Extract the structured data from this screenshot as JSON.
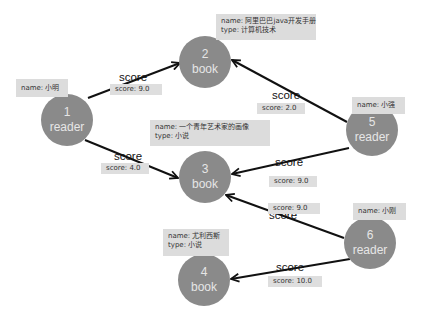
{
  "colors": {
    "node_fill": "#8a8a8a",
    "node_text": "#e6e6e6",
    "edge": "#111111",
    "label_box": "#dcdcdc"
  },
  "nodes": [
    {
      "id": "1",
      "type": "reader",
      "props": {
        "name": "name:  小明"
      }
    },
    {
      "id": "2",
      "type": "book",
      "props": {
        "name": "name:  阿里巴巴java开发手册",
        "type": "type: 计算机技术"
      }
    },
    {
      "id": "3",
      "type": "book",
      "props": {
        "name": "name:  一个青年艺术家的画像",
        "type": "type: 小说"
      }
    },
    {
      "id": "4",
      "type": "book",
      "props": {
        "name": "name:  尤利西斯",
        "type": "type: 小说"
      }
    },
    {
      "id": "5",
      "type": "reader",
      "props": {
        "name": "name:  小强"
      }
    },
    {
      "id": "6",
      "type": "reader",
      "props": {
        "name": "name:  小刚"
      }
    }
  ],
  "edges": [
    {
      "from": "1",
      "to": "2",
      "label": "score",
      "prop": "score: 9.0"
    },
    {
      "from": "1",
      "to": "3",
      "label": "score",
      "prop": "score: 4.0"
    },
    {
      "from": "5",
      "to": "2",
      "label": "score",
      "prop": "score: 2.0"
    },
    {
      "from": "5",
      "to": "3",
      "label": "score",
      "prop": "score: 9.0"
    },
    {
      "from": "6",
      "to": "3",
      "label": "score",
      "prop": "score: 9.0"
    },
    {
      "from": "6",
      "to": "4",
      "label": "score",
      "prop": "score: 10.0"
    }
  ]
}
